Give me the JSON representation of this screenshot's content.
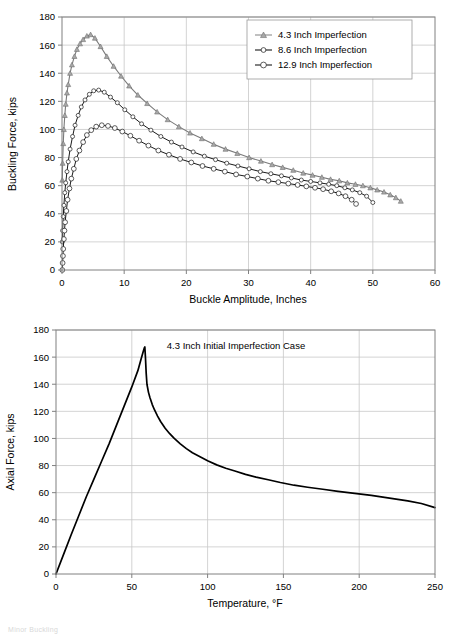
{
  "page": {
    "background": "#ffffff",
    "caption_fragment": "Minor Buckling"
  },
  "charts": [
    {
      "id": "buckling-force-chart",
      "axis": {
        "xlabel": "Buckle Amplitude, Inches",
        "ylabel": "Buckling Force, kips",
        "xticks": [
          "0",
          "10",
          "20",
          "30",
          "40",
          "50",
          "60"
        ],
        "yticks": [
          "0",
          "20",
          "40",
          "60",
          "80",
          "100",
          "120",
          "140",
          "160",
          "180"
        ]
      },
      "legend": {
        "items": [
          {
            "label": "4.3 Inch Imperfection",
            "marker": "triangle-marker",
            "color": "#8c8c8c"
          },
          {
            "label": "8.6 Inch Imperfection",
            "marker": "circle-marker",
            "color": "#1a1a1a"
          },
          {
            "label": "12.9 Inch Imperfection",
            "marker": "circle-marker",
            "color": "#1a1a1a"
          }
        ]
      }
    },
    {
      "id": "axial-force-chart",
      "axis": {
        "xlabel": "Temperature, °F",
        "ylabel": "Axial Force, kips",
        "xticks": [
          "0",
          "50",
          "100",
          "150",
          "200",
          "250"
        ],
        "yticks": [
          "0",
          "20",
          "40",
          "60",
          "80",
          "100",
          "120",
          "140",
          "160",
          "180"
        ]
      },
      "annotation": "4.3 Inch Initial Imperfection Case"
    }
  ],
  "chart_data": [
    {
      "type": "line",
      "title": "",
      "xlabel": "Buckle Amplitude, Inches",
      "ylabel": "Buckling Force, kips",
      "xlim": [
        0,
        60
      ],
      "ylim": [
        0,
        180
      ],
      "xticks": [
        0,
        10,
        20,
        30,
        40,
        50,
        60
      ],
      "yticks": [
        0,
        20,
        40,
        60,
        80,
        100,
        120,
        140,
        160,
        180
      ],
      "grid": true,
      "legend_position": "top-right",
      "markers": true,
      "series": [
        {
          "name": "4.3 Inch Imperfection",
          "color": "#8c8c8c",
          "marker": "triangle",
          "x": [
            0.05,
            0.1,
            0.2,
            0.3,
            0.45,
            0.6,
            0.8,
            1.0,
            1.3,
            1.6,
            2.0,
            2.4,
            2.9,
            3.4,
            4.0,
            4.6,
            5.3,
            6.2,
            7.2,
            8.3,
            9.5,
            10.8,
            12.2,
            13.7,
            15.3,
            17.0,
            18.8,
            20.6,
            22.5,
            24.4,
            26.3,
            28.2,
            30.1,
            32.0,
            33.8,
            35.5,
            37.2,
            38.8,
            40.3,
            41.8,
            43.2,
            44.6,
            45.9,
            47.2,
            48.4,
            49.6,
            50.7,
            51.8,
            52.8,
            53.7,
            54.5
          ],
          "y": [
            64,
            76,
            90,
            100,
            110,
            118,
            126,
            132,
            140,
            146,
            152,
            157,
            161,
            164,
            166.5,
            167.5,
            165,
            159,
            152,
            145,
            138,
            131,
            124.5,
            118.5,
            112.5,
            107,
            102,
            97.5,
            93.5,
            89.5,
            86,
            83,
            80,
            77.5,
            75,
            73,
            71,
            69,
            67.5,
            66,
            64.5,
            63.5,
            62,
            61,
            60,
            58.5,
            57,
            55.5,
            53.5,
            51.5,
            49
          ]
        },
        {
          "name": "8.6 Inch Imperfection",
          "color": "#1a1a1a",
          "marker": "circle",
          "x": [
            0.05,
            0.1,
            0.2,
            0.3,
            0.45,
            0.6,
            0.8,
            1.0,
            1.3,
            1.7,
            2.1,
            2.6,
            3.1,
            3.7,
            4.4,
            5.1,
            5.9,
            6.8,
            7.8,
            8.9,
            10.1,
            11.4,
            12.8,
            14.3,
            15.9,
            17.6,
            19.3,
            21.1,
            22.9,
            24.7,
            26.5,
            28.3,
            30.1,
            31.9,
            33.6,
            35.3,
            36.9,
            38.5,
            40.0,
            41.5,
            42.9,
            44.2,
            45.5,
            46.7,
            47.9,
            49.0,
            50.0
          ],
          "y": [
            20,
            28,
            38,
            46,
            55,
            62,
            70,
            77,
            86,
            95,
            103,
            110,
            116,
            121,
            125,
            127.5,
            128,
            126.5,
            123,
            119,
            114,
            109,
            104,
            99.5,
            95,
            91,
            87.5,
            84,
            81,
            78.5,
            76,
            74,
            72,
            70,
            68.5,
            67,
            65.5,
            64,
            63,
            62,
            61,
            60,
            58.5,
            57,
            55,
            52.5,
            48
          ]
        },
        {
          "name": "12.9 Inch Imperfection",
          "color": "#1a1a1a",
          "marker": "circle",
          "x": [
            0.05,
            0.1,
            0.15,
            0.2,
            0.3,
            0.4,
            0.5,
            0.7,
            0.9,
            1.2,
            1.5,
            1.9,
            2.3,
            2.8,
            3.4,
            4.0,
            4.7,
            5.5,
            6.4,
            7.4,
            8.5,
            9.7,
            11.0,
            12.4,
            13.9,
            15.5,
            17.2,
            19.0,
            20.8,
            22.6,
            24.4,
            26.2,
            28.0,
            29.8,
            31.5,
            33.2,
            34.8,
            36.4,
            37.9,
            39.3,
            40.7,
            42.0,
            43.3,
            44.5,
            45.6,
            46.6,
            47.3
          ],
          "y": [
            0,
            5,
            10,
            15,
            22,
            28,
            34,
            42,
            50,
            58,
            65,
            72,
            79,
            85,
            91,
            96,
            99.5,
            102,
            103,
            102.5,
            101,
            98.5,
            95.5,
            92,
            88.5,
            85,
            82,
            79,
            76.5,
            74,
            72,
            70,
            68,
            66.5,
            65,
            63.5,
            62.5,
            61.5,
            60.5,
            59.5,
            58.5,
            57.5,
            56,
            54.5,
            52.5,
            50,
            47
          ]
        }
      ]
    },
    {
      "type": "line",
      "title": "",
      "annotation": "4.3 Inch Initial Imperfection Case",
      "xlabel": "Temperature, °F",
      "ylabel": "Axial Force, kips",
      "xlim": [
        0,
        250
      ],
      "ylim": [
        0,
        180
      ],
      "xticks": [
        0,
        50,
        100,
        150,
        200,
        250
      ],
      "yticks": [
        0,
        20,
        40,
        60,
        80,
        100,
        120,
        140,
        160,
        180
      ],
      "grid": true,
      "markers": false,
      "series": [
        {
          "name": "4.3 Inch Initial Imperfection Case",
          "color": "#000000",
          "x": [
            0,
            5,
            10,
            15,
            20,
            25,
            30,
            35,
            40,
            45,
            50,
            54,
            56,
            57.5,
            58.3,
            58.6,
            59,
            59.5,
            60,
            61,
            62,
            63.5,
            65,
            67,
            69,
            72,
            75,
            78,
            82,
            86,
            90,
            95,
            100,
            106,
            112,
            118,
            125,
            132,
            140,
            148,
            157,
            166,
            176,
            186,
            197,
            208,
            220,
            232,
            241,
            250
          ],
          "y": [
            0,
            14.5,
            29,
            43,
            57,
            70,
            83,
            96,
            110,
            124,
            138,
            150,
            158,
            164,
            167,
            167.5,
            160,
            148,
            140,
            134,
            130,
            125,
            121,
            116.5,
            112.5,
            107.5,
            103.5,
            100,
            96,
            92.5,
            89.5,
            86.5,
            83.5,
            80.5,
            78,
            76,
            73.5,
            71.5,
            69.5,
            67.5,
            65.5,
            64,
            62.5,
            61,
            59.5,
            58,
            56,
            54,
            52,
            49
          ]
        }
      ]
    }
  ]
}
